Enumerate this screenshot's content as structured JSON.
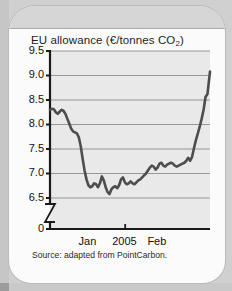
{
  "card": {
    "title_main": "EU allowance (€/tonnes CO",
    "title_sub": "2",
    "title_close": ")",
    "source_note": "Source: adapted from PointCarbon."
  },
  "colors": {
    "page_background": "#d0d0d0",
    "card_background": "#fbfbfb",
    "plot_background": "#e9e9e9",
    "gridline": "#8d8d8d",
    "axis": "#1a1a1a",
    "series_line": "#4d4d4d",
    "text": "#141414"
  },
  "chart_data": {
    "type": "line",
    "title": "EU allowance (€/tonnes CO2)",
    "xlabel": "",
    "ylabel": "",
    "ylim": [
      6.35,
      9.5
    ],
    "y_axis_break": true,
    "y_axis_break_symbol": "zigzag",
    "grid": true,
    "grid_axis": "y",
    "legend": "none",
    "ytick_labels": [
      "9.5",
      "9.0",
      "8.5",
      "8.0",
      "7.5",
      "7.0",
      "6.5",
      "0"
    ],
    "ytick_values": [
      9.5,
      9.0,
      8.5,
      8.0,
      7.5,
      7.0,
      6.5,
      0
    ],
    "xtick_labels": [
      "Jan",
      "2005",
      "Feb"
    ],
    "xtick_label_positions": [
      0.26,
      0.47,
      0.69
    ],
    "xtick_marks": [
      0.47
    ],
    "annotations": [],
    "series": [
      {
        "name": "EU allowance price",
        "x": [
          0.0,
          0.012,
          0.024,
          0.036,
          0.048,
          0.06,
          0.072,
          0.084,
          0.096,
          0.108,
          0.12,
          0.132,
          0.144,
          0.156,
          0.168,
          0.18,
          0.192,
          0.204,
          0.216,
          0.228,
          0.24,
          0.252,
          0.264,
          0.276,
          0.288,
          0.3,
          0.312,
          0.324,
          0.336,
          0.348,
          0.36,
          0.372,
          0.384,
          0.396,
          0.408,
          0.42,
          0.432,
          0.444,
          0.456,
          0.468,
          0.48,
          0.492,
          0.504,
          0.516,
          0.528,
          0.54,
          0.552,
          0.564,
          0.576,
          0.588,
          0.6,
          0.612,
          0.624,
          0.636,
          0.648,
          0.66,
          0.672,
          0.684,
          0.696,
          0.708,
          0.72,
          0.732,
          0.744,
          0.756,
          0.768,
          0.78,
          0.792,
          0.804,
          0.816,
          0.828,
          0.84,
          0.852,
          0.864,
          0.876,
          0.888,
          0.9,
          0.912,
          0.924,
          0.936,
          0.948,
          0.96,
          0.972,
          0.984,
          1.0
        ],
        "y": [
          8.3,
          8.32,
          8.31,
          8.25,
          8.22,
          8.26,
          8.3,
          8.28,
          8.22,
          8.12,
          8.02,
          7.92,
          7.86,
          7.84,
          7.82,
          7.74,
          7.56,
          7.3,
          7.06,
          6.88,
          6.76,
          6.72,
          6.74,
          6.8,
          6.78,
          6.72,
          6.8,
          6.94,
          6.86,
          6.72,
          6.62,
          6.58,
          6.68,
          6.72,
          6.74,
          6.7,
          6.76,
          6.88,
          6.92,
          6.82,
          6.78,
          6.8,
          6.84,
          6.8,
          6.78,
          6.82,
          6.86,
          6.88,
          6.92,
          6.96,
          7.0,
          7.06,
          7.12,
          7.16,
          7.14,
          7.08,
          7.12,
          7.2,
          7.22,
          7.16,
          7.14,
          7.18,
          7.2,
          7.22,
          7.2,
          7.16,
          7.14,
          7.16,
          7.18,
          7.2,
          7.22,
          7.26,
          7.32,
          7.26,
          7.34,
          7.52,
          7.68,
          7.82,
          7.96,
          8.12,
          8.3,
          8.56,
          8.62,
          9.08
        ]
      }
    ]
  }
}
